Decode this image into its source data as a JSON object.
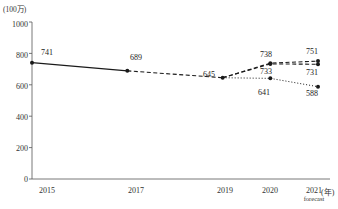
{
  "chart_data": {
    "type": "line",
    "title": "",
    "xlabel": "(年)",
    "ylabel": "(100万)",
    "ylim": [
      0,
      1000
    ],
    "yticks": [
      0,
      200,
      400,
      600,
      800,
      1000
    ],
    "grid": false,
    "legend": "none",
    "categories": [
      "2015",
      "2017",
      "2019",
      "2020",
      "2021"
    ],
    "x_sublabels": [
      "",
      "",
      "",
      "",
      "forecast"
    ],
    "series": [
      {
        "name": "actual",
        "style": "solid",
        "marker": "filled-circle",
        "x": [
          "2015",
          "2017"
        ],
        "values": [
          741,
          689
        ],
        "labels": [
          "741",
          "689"
        ]
      },
      {
        "name": "transition",
        "style": "dashed",
        "marker": "filled-circle",
        "x": [
          "2017",
          "2019"
        ],
        "values": [
          689,
          645
        ],
        "labels": [
          "",
          "645"
        ]
      },
      {
        "name": "upper-forecast",
        "style": "dashed",
        "marker": "filled-circle",
        "x": [
          "2019",
          "2020",
          "2021"
        ],
        "values": [
          645,
          738,
          751
        ],
        "labels": [
          "",
          "738",
          "751"
        ]
      },
      {
        "name": "middle-forecast",
        "style": "dashed",
        "marker": "filled-circle",
        "x": [
          "2019",
          "2020",
          "2021"
        ],
        "values": [
          645,
          733,
          731
        ],
        "labels": [
          "",
          "733",
          "731"
        ]
      },
      {
        "name": "lower-forecast",
        "style": "dotted",
        "marker": "filled-circle",
        "x": [
          "2019",
          "2020",
          "2021"
        ],
        "values": [
          645,
          641,
          588
        ],
        "labels": [
          "",
          "641",
          "588"
        ]
      }
    ]
  },
  "axis": {
    "unit_y": "(100万)",
    "unit_x": "(年)",
    "tick_1000": "1000",
    "tick_800": "800",
    "tick_600": "600",
    "tick_400": "400",
    "tick_200": "200",
    "tick_0": "0",
    "x_2015": "2015",
    "x_2017": "2017",
    "x_2019": "2019",
    "x_2020": "2020",
    "x_2021": "2021",
    "forecast_note": "forecast"
  },
  "labels": {
    "p741": "741",
    "p689": "689",
    "p645": "645",
    "p738": "738",
    "p733": "733",
    "p641": "641",
    "p751": "751",
    "p731": "731",
    "p588": "588"
  },
  "colors": {
    "line": "#1a1a1a",
    "axis": "#555555",
    "text": "#222222"
  }
}
